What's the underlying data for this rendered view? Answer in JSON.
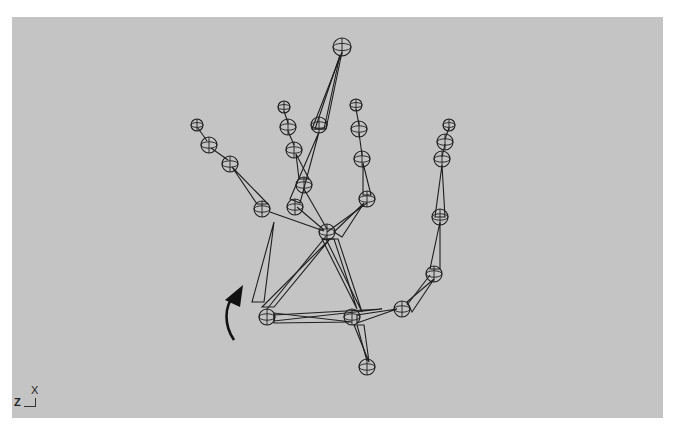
{
  "viewport": {
    "name": "3D viewport - hand skeleton rig",
    "background": "#c4c4c4",
    "line_color": "#1e1e1e"
  },
  "axis_indicator": {
    "up_label": "X",
    "left_label": "Z"
  },
  "rotation_arrow": {
    "icon": "curved-arrow-up",
    "color": "#111111"
  },
  "skeleton": {
    "joints": [
      {
        "id": "wrist",
        "x": 255,
        "y": 300
      },
      {
        "id": "palm_center",
        "x": 340,
        "y": 300
      },
      {
        "id": "palm_right",
        "x": 390,
        "y": 292
      },
      {
        "id": "knuckle_center",
        "x": 315,
        "y": 215
      },
      {
        "id": "thumb_base",
        "x": 422,
        "y": 257
      },
      {
        "id": "thumb_mid",
        "x": 428,
        "y": 200
      },
      {
        "id": "thumb_1",
        "x": 430,
        "y": 142
      },
      {
        "id": "thumb_2",
        "x": 433,
        "y": 125
      },
      {
        "id": "thumb_tip",
        "x": 437,
        "y": 108
      },
      {
        "id": "index_base",
        "x": 355,
        "y": 182
      },
      {
        "id": "index_1",
        "x": 350,
        "y": 142
      },
      {
        "id": "index_2",
        "x": 347,
        "y": 112
      },
      {
        "id": "index_tip",
        "x": 344,
        "y": 88
      },
      {
        "id": "middle_base",
        "x": 283,
        "y": 190
      },
      {
        "id": "middle_1",
        "x": 307,
        "y": 108
      },
      {
        "id": "middle_tip",
        "x": 330,
        "y": 30
      },
      {
        "id": "ring_base",
        "x": 292,
        "y": 168
      },
      {
        "id": "ring_1",
        "x": 282,
        "y": 133
      },
      {
        "id": "ring_2",
        "x": 276,
        "y": 110
      },
      {
        "id": "ring_tip",
        "x": 272,
        "y": 90
      },
      {
        "id": "pinky_base",
        "x": 250,
        "y": 192
      },
      {
        "id": "pinky_1",
        "x": 218,
        "y": 147
      },
      {
        "id": "pinky_2",
        "x": 197,
        "y": 128
      },
      {
        "id": "pinky_tip",
        "x": 185,
        "y": 108
      },
      {
        "id": "lower",
        "x": 355,
        "y": 350
      }
    ]
  }
}
